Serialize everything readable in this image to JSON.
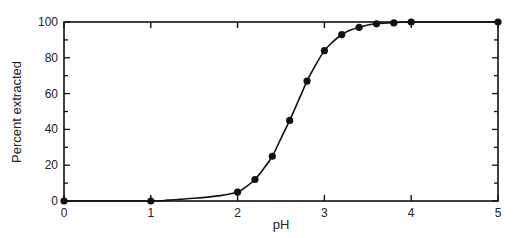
{
  "chart_data": {
    "type": "line",
    "title": "",
    "xlabel": "pH",
    "ylabel": "Percent extracted",
    "xlim": [
      0,
      5
    ],
    "ylim": [
      0,
      100
    ],
    "x_ticks": [
      0,
      1,
      2,
      3,
      4,
      5
    ],
    "y_ticks": [
      0,
      20,
      40,
      60,
      80,
      100
    ],
    "grid": false,
    "legend": null,
    "series": [
      {
        "name": "Percent extracted",
        "marker": "filled-circle",
        "x": [
          0,
          1,
          2,
          2.2,
          2.4,
          2.6,
          2.8,
          3.0,
          3.2,
          3.4,
          3.6,
          3.8,
          4.0,
          5.0
        ],
        "values": [
          0,
          0,
          5,
          12,
          25,
          45,
          67,
          84,
          93,
          97,
          99,
          99.5,
          100,
          100
        ]
      }
    ],
    "fit_curve": {
      "x": [
        0,
        1,
        1.2,
        1.5,
        1.8,
        2.0,
        2.1,
        2.2,
        2.3,
        2.4,
        2.5,
        2.6,
        2.7,
        2.8,
        2.9,
        3.0,
        3.1,
        3.2,
        3.3,
        3.4,
        3.5,
        3.6,
        3.8,
        4.0,
        5.0
      ],
      "values": [
        0,
        0,
        0.5,
        1.5,
        3,
        5,
        8,
        12,
        18,
        25,
        35,
        45,
        56,
        67,
        76,
        84,
        89,
        93,
        95.5,
        97,
        98.3,
        99,
        99.6,
        100,
        100
      ]
    }
  },
  "axes": {
    "xlabel": "pH",
    "ylabel": "Percent extracted",
    "x_tick_labels": [
      "0",
      "1",
      "2",
      "3",
      "4",
      "5"
    ],
    "y_tick_labels": [
      "0",
      "20",
      "40",
      "60",
      "80",
      "100"
    ]
  },
  "colors": {
    "line": "#111111",
    "marker": "#111111",
    "axis": "#111111",
    "background": "#ffffff"
  }
}
